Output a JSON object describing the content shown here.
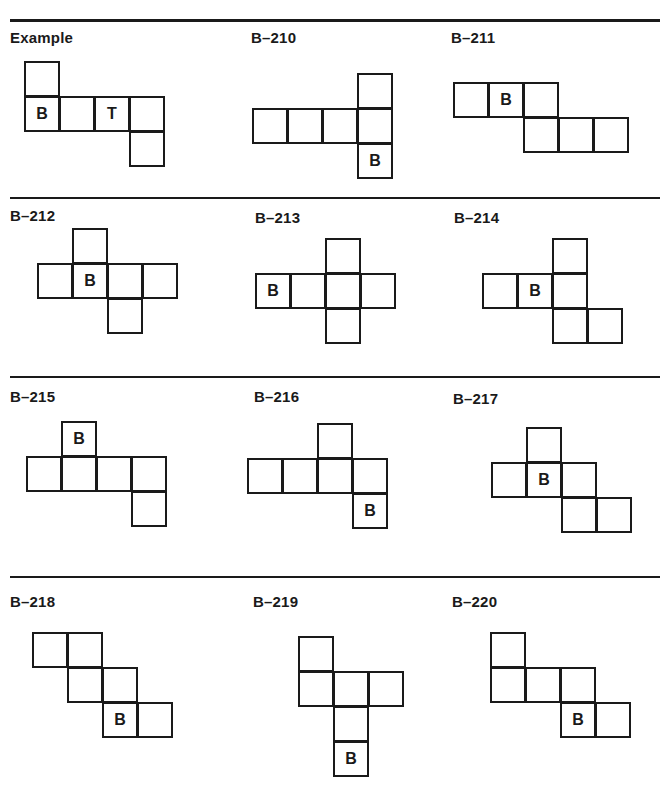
{
  "page": {
    "rules": [
      {
        "top": 19,
        "height": 3
      },
      {
        "top": 197,
        "height": 2
      },
      {
        "top": 376,
        "height": 2
      },
      {
        "top": 576,
        "height": 2
      }
    ]
  },
  "cell_size": 36,
  "panels": [
    {
      "id": "example",
      "label": "Example",
      "label_x": 10,
      "label_y": 29,
      "origin_x": 24,
      "origin_y": 61,
      "cells": [
        [
          0,
          0,
          ""
        ],
        [
          0,
          1,
          "B"
        ],
        [
          1,
          1,
          ""
        ],
        [
          2,
          1,
          "T"
        ],
        [
          3,
          1,
          ""
        ],
        [
          3,
          2,
          ""
        ]
      ]
    },
    {
      "id": "b-210",
      "label": "B–210",
      "label_x": 251,
      "label_y": 29,
      "origin_x": 252,
      "origin_y": 73,
      "cells": [
        [
          3,
          0,
          ""
        ],
        [
          0,
          1,
          ""
        ],
        [
          1,
          1,
          ""
        ],
        [
          2,
          1,
          ""
        ],
        [
          3,
          1,
          ""
        ],
        [
          3,
          2,
          "B"
        ]
      ]
    },
    {
      "id": "b-211",
      "label": "B–211",
      "label_x": 451,
      "label_y": 29,
      "origin_x": 453,
      "origin_y": 82,
      "cells": [
        [
          0,
          0,
          ""
        ],
        [
          1,
          0,
          "B"
        ],
        [
          2,
          0,
          ""
        ],
        [
          2,
          1,
          ""
        ],
        [
          3,
          1,
          ""
        ],
        [
          4,
          1,
          ""
        ]
      ]
    },
    {
      "id": "b-212",
      "label": "B–212",
      "label_x": 10,
      "label_y": 207,
      "origin_x": 37,
      "origin_y": 228,
      "cells": [
        [
          1,
          0,
          ""
        ],
        [
          0,
          1,
          ""
        ],
        [
          1,
          1,
          "B"
        ],
        [
          2,
          1,
          ""
        ],
        [
          3,
          1,
          ""
        ],
        [
          2,
          2,
          ""
        ]
      ]
    },
    {
      "id": "b-213",
      "label": "B–213",
      "label_x": 255,
      "label_y": 209,
      "origin_x": 255,
      "origin_y": 238,
      "cells": [
        [
          2,
          0,
          ""
        ],
        [
          0,
          1,
          "B"
        ],
        [
          1,
          1,
          ""
        ],
        [
          2,
          1,
          ""
        ],
        [
          3,
          1,
          ""
        ],
        [
          2,
          2,
          ""
        ]
      ]
    },
    {
      "id": "b-214",
      "label": "B–214",
      "label_x": 454,
      "label_y": 209,
      "origin_x": 482,
      "origin_y": 238,
      "cells": [
        [
          2,
          0,
          ""
        ],
        [
          0,
          1,
          ""
        ],
        [
          1,
          1,
          "B"
        ],
        [
          2,
          1,
          ""
        ],
        [
          2,
          2,
          ""
        ],
        [
          3,
          2,
          ""
        ]
      ]
    },
    {
      "id": "b-215",
      "label": "B–215",
      "label_x": 10,
      "label_y": 388,
      "origin_x": 26,
      "origin_y": 421,
      "cells": [
        [
          1,
          0,
          "B"
        ],
        [
          0,
          1,
          ""
        ],
        [
          1,
          1,
          ""
        ],
        [
          2,
          1,
          ""
        ],
        [
          3,
          1,
          ""
        ],
        [
          3,
          2,
          ""
        ]
      ]
    },
    {
      "id": "b-216",
      "label": "B–216",
      "label_x": 254,
      "label_y": 388,
      "origin_x": 247,
      "origin_y": 423,
      "cells": [
        [
          2,
          0,
          ""
        ],
        [
          0,
          1,
          ""
        ],
        [
          1,
          1,
          ""
        ],
        [
          2,
          1,
          ""
        ],
        [
          3,
          1,
          ""
        ],
        [
          3,
          2,
          "B"
        ]
      ]
    },
    {
      "id": "b-217",
      "label": "B–217",
      "label_x": 453,
      "label_y": 390,
      "origin_x": 491,
      "origin_y": 427,
      "cells": [
        [
          1,
          0,
          ""
        ],
        [
          0,
          1,
          ""
        ],
        [
          1,
          1,
          "B"
        ],
        [
          2,
          1,
          ""
        ],
        [
          2,
          2,
          ""
        ],
        [
          3,
          2,
          ""
        ]
      ]
    },
    {
      "id": "b-218",
      "label": "B–218",
      "label_x": 10,
      "label_y": 593,
      "origin_x": 32,
      "origin_y": 632,
      "cells": [
        [
          0,
          0,
          ""
        ],
        [
          1,
          0,
          ""
        ],
        [
          1,
          1,
          ""
        ],
        [
          2,
          1,
          ""
        ],
        [
          2,
          2,
          "B"
        ],
        [
          3,
          2,
          ""
        ]
      ]
    },
    {
      "id": "b-219",
      "label": "B–219",
      "label_x": 253,
      "label_y": 593,
      "origin_x": 298,
      "origin_y": 636,
      "cells": [
        [
          0,
          0,
          ""
        ],
        [
          0,
          1,
          ""
        ],
        [
          1,
          1,
          ""
        ],
        [
          2,
          1,
          ""
        ],
        [
          1,
          2,
          ""
        ],
        [
          1,
          3,
          "B"
        ]
      ]
    },
    {
      "id": "b-220",
      "label": "B–220",
      "label_x": 452,
      "label_y": 593,
      "origin_x": 490,
      "origin_y": 632,
      "cells": [
        [
          0,
          0,
          ""
        ],
        [
          0,
          1,
          ""
        ],
        [
          1,
          1,
          ""
        ],
        [
          2,
          1,
          ""
        ],
        [
          2,
          2,
          "B"
        ],
        [
          3,
          2,
          ""
        ]
      ]
    }
  ]
}
